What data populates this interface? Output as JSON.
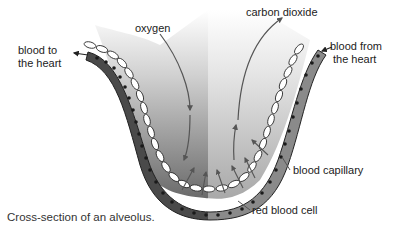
{
  "diagram": {
    "caption": "Cross-section of an alveolus.",
    "labels": {
      "oxygen": "oxygen",
      "carbon_dioxide": "carbon dioxide",
      "blood_to_heart_line1": "blood to",
      "blood_to_heart_line2": "the heart",
      "blood_from_heart_line1": "blood from",
      "blood_from_heart_line2": "the heart",
      "blood_capillary": "blood capillary",
      "red_blood_cell": "red blood cell"
    },
    "colors": {
      "capillary_left": "#4a4a4a",
      "capillary_right": "#8a8a8a",
      "red_blood_cell_dot": "#1a1a1a",
      "alveolus_dark": "#6e6e6e",
      "alveolus_light": "#d8d8d8",
      "arrow": "#555555"
    }
  }
}
